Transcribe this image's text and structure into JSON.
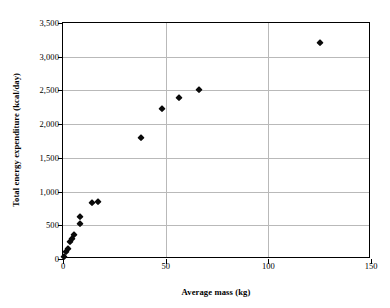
{
  "chart_data": {
    "type": "scatter",
    "title": "",
    "xlabel": "Average mass (kg)",
    "ylabel": "Total energy expenditure (kcal/day)",
    "xlim": [
      0,
      150
    ],
    "ylim": [
      0,
      3500
    ],
    "xticks": [
      0,
      50,
      100,
      150
    ],
    "yticks": [
      0,
      500,
      1000,
      1500,
      2000,
      2500,
      3000,
      3500
    ],
    "xtick_labels": [
      "0",
      "50",
      "100",
      "150"
    ],
    "ytick_labels": [
      "0",
      "500",
      "1,000",
      "1,500",
      "2,000",
      "2,500",
      "3,000",
      "3,500"
    ],
    "grid": "horizontal-and-vertical",
    "legend": "none",
    "marker": "diamond",
    "marker_color": "#0a0a0a",
    "points": [
      {
        "x": 0.5,
        "y": 30
      },
      {
        "x": 1.5,
        "y": 110
      },
      {
        "x": 2.5,
        "y": 150
      },
      {
        "x": 3.5,
        "y": 250
      },
      {
        "x": 4.5,
        "y": 290
      },
      {
        "x": 5.5,
        "y": 350
      },
      {
        "x": 8.5,
        "y": 520
      },
      {
        "x": 8.5,
        "y": 630
      },
      {
        "x": 14.0,
        "y": 830
      },
      {
        "x": 17.0,
        "y": 850
      },
      {
        "x": 38.0,
        "y": 1790
      },
      {
        "x": 48.0,
        "y": 2230
      },
      {
        "x": 56.5,
        "y": 2390
      },
      {
        "x": 66.0,
        "y": 2500
      },
      {
        "x": 125.0,
        "y": 3200
      }
    ]
  }
}
